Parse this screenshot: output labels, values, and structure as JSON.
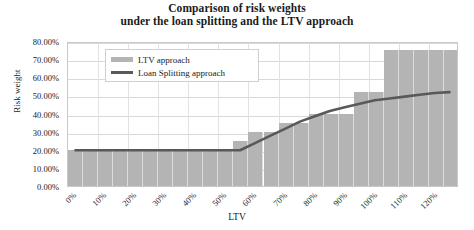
{
  "chart_data": {
    "type": "bar",
    "title": "Comparison of risk weights",
    "subtitle": "under the loan splitting and the LTV approach",
    "xlabel": "LTV",
    "ylabel": "Risk weight",
    "xlim": [
      0,
      130
    ],
    "ylim": [
      0,
      80
    ],
    "grid": true,
    "legend_position": "top-left-inside",
    "categories": [
      "0%",
      "10%",
      "20%",
      "30%",
      "40%",
      "50%",
      "60%",
      "70%",
      "80%",
      "90%",
      "100%",
      "110%",
      "120%"
    ],
    "x_tick_labels": [
      "0%",
      "10%",
      "20%",
      "30%",
      "40%",
      "50%",
      "60%",
      "70%",
      "80%",
      "90%",
      "100%",
      "110%",
      "120%"
    ],
    "y_tick_labels": [
      "0.00%",
      "10.00%",
      "20.00%",
      "30.00%",
      "40.00%",
      "50.00%",
      "60.00%",
      "70.00%",
      "80.00%"
    ],
    "y_tick_values": [
      0,
      10,
      20,
      30,
      40,
      50,
      60,
      70,
      80
    ],
    "series": [
      {
        "name": "LTV approach",
        "type": "bar",
        "color": "#b4b4b4",
        "x": [
          0,
          5,
          10,
          15,
          20,
          25,
          30,
          35,
          40,
          45,
          50,
          55,
          60,
          65,
          70,
          75,
          80,
          85,
          90,
          95,
          100,
          105,
          110,
          115,
          120,
          125
        ],
        "values": [
          20,
          20,
          20,
          20,
          20,
          20,
          20,
          20,
          20,
          20,
          20,
          25,
          30,
          30,
          35,
          35,
          40,
          40,
          40,
          52,
          52,
          75,
          75,
          75,
          75,
          75
        ]
      },
      {
        "name": "Loan Splitting approach",
        "type": "line",
        "color": "#595959",
        "x": [
          0,
          10,
          20,
          30,
          40,
          50,
          55,
          60,
          65,
          70,
          75,
          80,
          85,
          90,
          95,
          100,
          105,
          110,
          115,
          120,
          125
        ],
        "values": [
          20,
          20,
          20,
          20,
          20,
          20,
          20,
          24,
          28,
          32,
          36,
          39,
          42,
          44,
          46,
          48,
          49,
          50,
          51,
          52,
          52.5
        ]
      }
    ]
  },
  "legend": {
    "items": [
      {
        "label": "LTV approach",
        "swatch": "bar",
        "color": "#b4b4b4"
      },
      {
        "label": "Loan Splitting approach",
        "swatch": "line",
        "color": "#595959"
      }
    ]
  },
  "colors": {
    "bar": "#b4b4b4",
    "line": "#595959",
    "grid": "#d9d9d9",
    "plot_border": "#c9c9c9",
    "background": "#ffffff",
    "text": "#1a1a1a"
  }
}
